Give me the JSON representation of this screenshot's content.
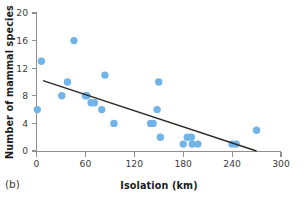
{
  "figure": {
    "panel_label": "(b)",
    "point_color": "#71b5e8",
    "line_color": "#2f2a26",
    "axis_color": "#8f8f8f"
  },
  "chart_data": {
    "type": "scatter",
    "title": "",
    "subtitle": "",
    "xlabel": "Isolation (km)",
    "ylabel": "Number of mammal species",
    "xlim": [
      0,
      300
    ],
    "ylim": [
      0,
      20
    ],
    "xticks": [
      0,
      60,
      120,
      180,
      240,
      300
    ],
    "yticks": [
      0,
      4,
      8,
      12,
      16,
      20
    ],
    "xtick_labels": [
      "0",
      "60",
      "120",
      "180",
      "240",
      "300"
    ],
    "ytick_labels": [
      "0",
      "4",
      "8",
      "12",
      "16",
      "20"
    ],
    "grid": false,
    "legend": null,
    "legend_position": "none",
    "annotations": [
      "(b)"
    ],
    "points": [
      {
        "x": 1,
        "y": 6
      },
      {
        "x": 6,
        "y": 13
      },
      {
        "x": 31,
        "y": 8
      },
      {
        "x": 38,
        "y": 10
      },
      {
        "x": 46,
        "y": 16
      },
      {
        "x": 60,
        "y": 8
      },
      {
        "x": 62,
        "y": 8
      },
      {
        "x": 67,
        "y": 7
      },
      {
        "x": 71,
        "y": 7
      },
      {
        "x": 80,
        "y": 6
      },
      {
        "x": 84,
        "y": 11
      },
      {
        "x": 95,
        "y": 4
      },
      {
        "x": 140,
        "y": 4
      },
      {
        "x": 143,
        "y": 4
      },
      {
        "x": 148,
        "y": 6
      },
      {
        "x": 150,
        "y": 10
      },
      {
        "x": 152,
        "y": 2
      },
      {
        "x": 180,
        "y": 1
      },
      {
        "x": 185,
        "y": 2
      },
      {
        "x": 190,
        "y": 2
      },
      {
        "x": 191,
        "y": 1
      },
      {
        "x": 198,
        "y": 1
      },
      {
        "x": 240,
        "y": 1
      },
      {
        "x": 245,
        "y": 1
      },
      {
        "x": 270,
        "y": 3
      }
    ],
    "trend_line": {
      "type": "linear-fit",
      "x_start": 8,
      "y_start": 10.2,
      "x_end": 270,
      "y_end": 0.0
    }
  }
}
